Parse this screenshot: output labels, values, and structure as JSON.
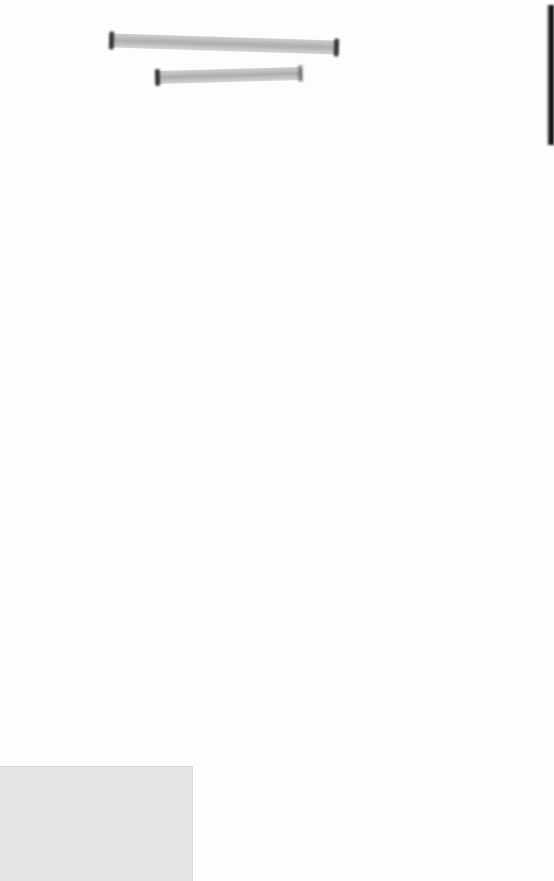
{
  "document": {
    "type": "scanned page",
    "header": {
      "line1": "[redacted]",
      "line2": "[redacted]"
    },
    "body_text": "",
    "colors": {
      "paper": "#fdfdfd",
      "redaction_mark": "#8c8c8c",
      "edge_shadow": "#111111",
      "gray_box": "#e4e4e4"
    }
  }
}
